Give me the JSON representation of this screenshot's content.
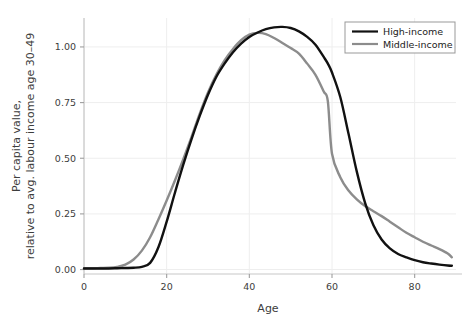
{
  "chart_data": {
    "type": "line",
    "title": "",
    "xlabel": "Age",
    "ylabel_line1": "Per capita value,",
    "ylabel_line2": "relative to avg. labour income age 30–49",
    "xlim": [
      0,
      90
    ],
    "ylim": [
      -0.02,
      1.13
    ],
    "xticks": [
      0,
      20,
      40,
      60,
      80
    ],
    "xticklabels": [
      "0",
      "20",
      "40",
      "60",
      "80"
    ],
    "yticks": [
      0.0,
      0.25,
      0.5,
      0.75,
      1.0
    ],
    "yticklabels": [
      "0.00",
      "0.25",
      "0.50",
      "0.75",
      "1.00"
    ],
    "grid": true,
    "legend_position": "top-right",
    "x": [
      0,
      2,
      4,
      6,
      8,
      10,
      12,
      14,
      16,
      18,
      20,
      22,
      24,
      26,
      28,
      30,
      32,
      34,
      36,
      38,
      40,
      42,
      44,
      46,
      48,
      50,
      52,
      54,
      56,
      58,
      59,
      60,
      62,
      64,
      66,
      68,
      70,
      72,
      74,
      76,
      78,
      80,
      82,
      84,
      86,
      88,
      89
    ],
    "series": [
      {
        "name": "High-income",
        "color": "#111111",
        "linewidth": 2.4,
        "values": [
          0.005,
          0.005,
          0.005,
          0.005,
          0.006,
          0.007,
          0.008,
          0.012,
          0.03,
          0.1,
          0.215,
          0.345,
          0.47,
          0.585,
          0.69,
          0.785,
          0.865,
          0.925,
          0.975,
          1.015,
          1.045,
          1.065,
          1.08,
          1.088,
          1.09,
          1.085,
          1.07,
          1.045,
          1.01,
          0.955,
          0.925,
          0.885,
          0.775,
          0.61,
          0.44,
          0.3,
          0.2,
          0.135,
          0.095,
          0.07,
          0.055,
          0.042,
          0.033,
          0.027,
          0.022,
          0.018,
          0.017
        ]
      },
      {
        "name": "Middle-income",
        "color": "#8c8c8c",
        "linewidth": 2.4,
        "values": [
          0.006,
          0.006,
          0.007,
          0.008,
          0.012,
          0.022,
          0.045,
          0.085,
          0.145,
          0.225,
          0.31,
          0.4,
          0.495,
          0.595,
          0.7,
          0.795,
          0.875,
          0.94,
          0.99,
          1.03,
          1.055,
          1.063,
          1.058,
          1.04,
          1.018,
          0.995,
          0.97,
          0.925,
          0.875,
          0.8,
          0.755,
          0.52,
          0.415,
          0.355,
          0.315,
          0.285,
          0.262,
          0.24,
          0.215,
          0.19,
          0.165,
          0.145,
          0.125,
          0.108,
          0.092,
          0.072,
          0.055
        ]
      }
    ]
  },
  "legend": {
    "entries": [
      {
        "label": "High-income",
        "color": "#111111"
      },
      {
        "label": "Middle-income",
        "color": "#8c8c8c"
      }
    ]
  },
  "axes": {
    "spine_color": "#bdbdbd",
    "grid_color": "#eeeeee",
    "tick_color": "#9e9e9e",
    "text_color": "#3d3d3d"
  }
}
